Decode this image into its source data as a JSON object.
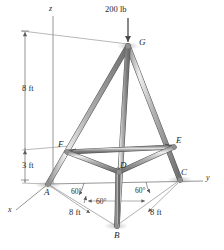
{
  "figure": {
    "colors": {
      "member_fill": "#a9a9a9",
      "member_light": "#e3e3e3",
      "member_dark": "#6f6f6f",
      "line": "#6b6b6b",
      "text": "#1f1f1f",
      "background": "#ffffff"
    }
  },
  "load": {
    "label": "200 lb",
    "magnitude": 200,
    "units": "lb",
    "direction": "downward",
    "applied_at": "G"
  },
  "axes": [
    {
      "name": "z-axis",
      "label": "z"
    },
    {
      "name": "y-axis",
      "label": "y"
    },
    {
      "name": "x-axis",
      "label": "x"
    }
  ],
  "joints": [
    {
      "id": "A",
      "label": "A"
    },
    {
      "id": "B",
      "label": "B"
    },
    {
      "id": "C",
      "label": "C"
    },
    {
      "id": "D",
      "label": "D"
    },
    {
      "id": "E",
      "label": "E"
    },
    {
      "id": "F",
      "label": "F"
    },
    {
      "id": "G",
      "label": "G"
    }
  ],
  "dimensions": [
    {
      "id": "height-upper",
      "label": "8 ft",
      "value": 8,
      "units": "ft"
    },
    {
      "id": "height-lower",
      "label": "3 ft",
      "value": 3,
      "units": "ft"
    },
    {
      "id": "base-left",
      "label": "8 ft",
      "value": 8,
      "units": "ft"
    },
    {
      "id": "base-right",
      "label": "8 ft",
      "value": 8,
      "units": "ft"
    }
  ],
  "angles": [
    {
      "id": "angle-left",
      "label": "60°",
      "value": 60
    },
    {
      "id": "angle-right",
      "label": "60°",
      "value": 60
    },
    {
      "id": "angle-base",
      "label": "60°",
      "value": 60
    }
  ]
}
